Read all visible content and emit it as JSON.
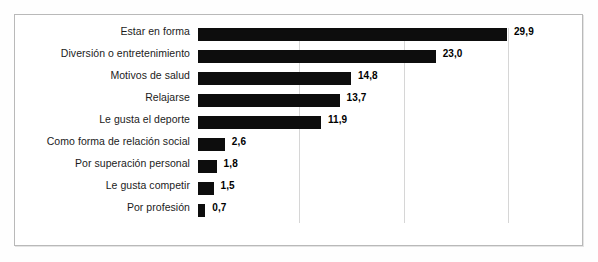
{
  "figure": {
    "frame_color": "#b9b9b9",
    "background": "#ffffff",
    "bar_color": "#0d0d0d",
    "gridline_color": "#d6d6d6"
  },
  "chart_data": {
    "type": "bar",
    "orientation": "horizontal",
    "title": "",
    "subtitle": "",
    "xlabel": "",
    "ylabel": "",
    "xlim": [
      0,
      30
    ],
    "grid": true,
    "gridlines": [
      10,
      20,
      30
    ],
    "tick_labels_visible": false,
    "legend": null,
    "legend_position": "none",
    "value_label_format": "comma-decimal",
    "categories": [
      "Estar en forma",
      "Diversión o entretenimiento",
      "Motivos de salud",
      "Relajarse",
      "Le gusta el deporte",
      "Como forma de relación social",
      "Por superación personal",
      "Le gusta competir",
      "Por profesión"
    ],
    "values": [
      29.9,
      23.0,
      14.8,
      13.7,
      11.9,
      2.6,
      1.8,
      1.5,
      0.7
    ],
    "value_labels": [
      "29,9",
      "23,0",
      "14,8",
      "13,7",
      "11,9",
      "2,6",
      "1,8",
      "1,5",
      "0,7"
    ]
  }
}
